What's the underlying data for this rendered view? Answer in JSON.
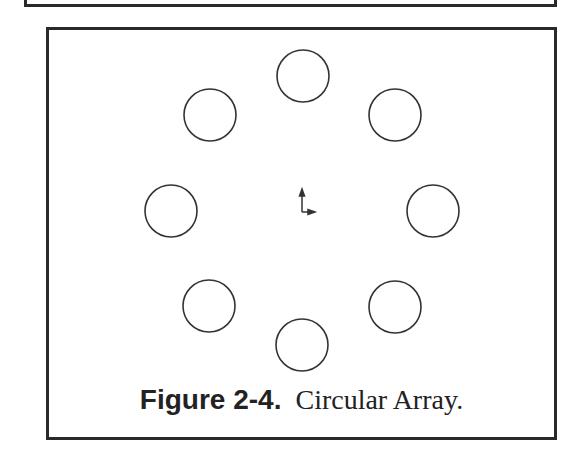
{
  "figure": {
    "number_label": "Figure 2-4.",
    "title": "Circular Array.",
    "border_color": "#2a2a2a",
    "stroke_color": "#333333"
  },
  "circles": [
    {
      "cx": 303,
      "cy": 76,
      "r": 26
    },
    {
      "cx": 395,
      "cy": 115,
      "r": 26
    },
    {
      "cx": 433,
      "cy": 211,
      "r": 26
    },
    {
      "cx": 395,
      "cy": 307,
      "r": 26
    },
    {
      "cx": 302,
      "cy": 345,
      "r": 26
    },
    {
      "cx": 209,
      "cy": 306,
      "r": 26
    },
    {
      "cx": 171,
      "cy": 211,
      "r": 26
    },
    {
      "cx": 210,
      "cy": 115,
      "r": 26
    }
  ],
  "origin_axis": {
    "x": 302,
    "y": 212,
    "length_y": 20,
    "length_x": 11
  }
}
